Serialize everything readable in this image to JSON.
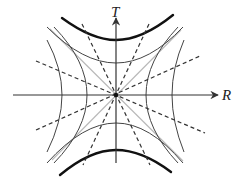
{
  "diagram": {
    "type": "kruskal-szekeres-style-spacetime-diagram",
    "axes": {
      "horizontal_label": "R",
      "vertical_label": "T"
    },
    "elements": {
      "spacelike_hyperbolas": "thin curves opening left and right (constant r)",
      "timelike_hyperbolas_inner": "thin curves opening up and down",
      "singularity_hyperbolas": "thick curves at top and bottom",
      "horizons": "light gray diagonal lines through origin",
      "constant_time_lines": "dashed straight lines through origin"
    },
    "colors": {
      "axis": "#333333",
      "curve": "#444444",
      "thick_curve": "#111111",
      "horizon": "#b8b8b8",
      "dashed": "#333333"
    }
  }
}
